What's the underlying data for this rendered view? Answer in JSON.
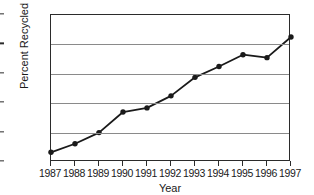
{
  "chart_data": {
    "type": "line",
    "title": "",
    "xlabel": "Year",
    "ylabel": "Percent Recycled",
    "categories": [
      "1987",
      "1988",
      "1989",
      "1990",
      "1991",
      "1992",
      "1993",
      "1994",
      "1995",
      "1996",
      "1997"
    ],
    "x": [
      1987,
      1988,
      1989,
      1990,
      1991,
      1992,
      1993,
      1994,
      1995,
      1996,
      1997
    ],
    "values": [
      3.3,
      6.2,
      10.0,
      17.0,
      18.4,
      22.5,
      28.8,
      32.5,
      36.5,
      35.5,
      42.5
    ],
    "series": [
      {
        "name": "Percent Recycled",
        "values": [
          3.3,
          6.2,
          10.0,
          17.0,
          18.4,
          22.5,
          28.8,
          32.5,
          36.5,
          35.5,
          42.5
        ]
      }
    ],
    "ylim": [
      0,
      50
    ],
    "yticks": [
      0,
      10,
      20,
      30,
      40,
      50
    ],
    "yticklabels": [
      "0",
      "10",
      "20",
      "30",
      "40",
      "50"
    ],
    "xlim": [
      1987,
      1997
    ],
    "grid": "horizontal",
    "legend": "none",
    "marker": "filled-circle",
    "line_color": "#1a1a1a",
    "marker_color": "#1a1a1a",
    "grid_color": "#8a8a8a",
    "frame_color": "#2b2b2b",
    "background": "#ffffff"
  }
}
